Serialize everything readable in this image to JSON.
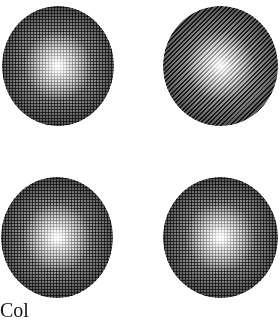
{
  "figure": {
    "spheres": [
      {
        "position": "top-left",
        "screen": "dot"
      },
      {
        "position": "top-right",
        "screen": "diagonal-line"
      },
      {
        "position": "bottom-left",
        "screen": "dot"
      },
      {
        "position": "bottom-right",
        "screen": "dot"
      }
    ],
    "caption_partial": "Col",
    "colors": {
      "background": "#ffffff",
      "ink": "#000000"
    }
  }
}
